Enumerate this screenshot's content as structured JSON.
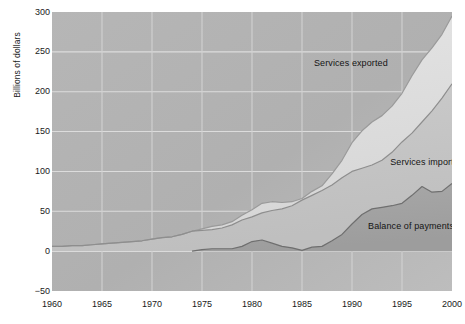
{
  "chart_data": {
    "type": "area",
    "title": "",
    "xlabel": "",
    "ylabel": "Billions of dollars",
    "xlim": [
      1960,
      2000
    ],
    "ylim": [
      -50,
      300
    ],
    "ytick_labels": [
      "300",
      "250",
      "200",
      "150",
      "100",
      "50",
      "0",
      "-50"
    ],
    "ytick_values": [
      300,
      250,
      200,
      150,
      100,
      50,
      0,
      -50
    ],
    "xtick_labels": [
      "1960",
      "1965",
      "1970",
      "1975",
      "1980",
      "1985",
      "1990",
      "1995",
      "2000"
    ],
    "xtick_values": [
      1960,
      1965,
      1970,
      1975,
      1980,
      1985,
      1990,
      1995,
      2000
    ],
    "grid": true,
    "legend_position": "inline",
    "x": [
      1960,
      1961,
      1962,
      1963,
      1964,
      1965,
      1966,
      1967,
      1968,
      1969,
      1970,
      1971,
      1972,
      1973,
      1974,
      1975,
      1976,
      1977,
      1978,
      1979,
      1980,
      1981,
      1982,
      1983,
      1984,
      1985,
      1986,
      1987,
      1988,
      1989,
      1990,
      1991,
      1992,
      1993,
      1994,
      1995,
      1996,
      1997,
      1998,
      1999,
      2000
    ],
    "series": [
      {
        "name": "Services exported",
        "color": "#dedede",
        "values": [
          6,
          6,
          7,
          7,
          8,
          9,
          10,
          11,
          12,
          13,
          15,
          17,
          18,
          21,
          25,
          28,
          31,
          33,
          37,
          45,
          52,
          60,
          62,
          61,
          62,
          66,
          75,
          82,
          97,
          114,
          136,
          151,
          162,
          170,
          182,
          198,
          220,
          240,
          255,
          272,
          295
        ]
      },
      {
        "name": "Services imported",
        "color": "#c6c6c6",
        "values": [
          6,
          6,
          7,
          7,
          8,
          9,
          10,
          11,
          12,
          13,
          15,
          17,
          18,
          21,
          25,
          26,
          27,
          29,
          33,
          39,
          43,
          48,
          51,
          53,
          57,
          64,
          70,
          76,
          83,
          92,
          100,
          104,
          108,
          114,
          124,
          137,
          148,
          162,
          176,
          192,
          210
        ]
      },
      {
        "name": "Balance of payments",
        "color": "#a3a3a3",
        "values": [
          null,
          null,
          null,
          null,
          null,
          null,
          null,
          null,
          null,
          null,
          null,
          null,
          null,
          null,
          0,
          2,
          3,
          3,
          3,
          6,
          12,
          14,
          10,
          6,
          4,
          1,
          5,
          6,
          13,
          21,
          34,
          46,
          53,
          55,
          57,
          60,
          70,
          81,
          74,
          75,
          85
        ]
      }
    ],
    "annotations": [
      {
        "text": "Services exported",
        "x": 1990,
        "y": 235
      },
      {
        "text": "Services imported",
        "x": 1995,
        "y": 110
      },
      {
        "text": "Balance of payments",
        "x": 1994,
        "y": 30
      }
    ]
  },
  "axes": {
    "y_title": "Billions of dollars"
  }
}
